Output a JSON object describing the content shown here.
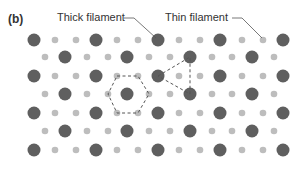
{
  "figure": {
    "panel_label": "(b)",
    "labels": {
      "thick": "Thick filament",
      "thin": "Thin filament"
    },
    "colors": {
      "thick_filament": "#5f5f5f",
      "thin_filament": "#bdbdbd",
      "dashed_line": "#555555",
      "leader_line": "#555555",
      "text": "#333333"
    },
    "lattice": {
      "row_y": [
        40,
        57,
        76,
        94,
        113,
        131,
        150
      ],
      "row_type_A_big_x": [
        34,
        96,
        158,
        220,
        283
      ],
      "row_type_A_small_x": [
        55,
        76,
        117,
        138,
        179,
        200,
        242,
        263
      ],
      "row_type_B_big_x": [
        65,
        127,
        190,
        252
      ],
      "row_type_B_small_x": [
        45,
        87,
        108,
        149,
        170,
        212,
        232,
        274
      ],
      "row_types": [
        "A",
        "B",
        "A",
        "B",
        "A",
        "B",
        "A"
      ],
      "big_radius": 6.5,
      "small_radius": 3.3
    },
    "hexagon": {
      "center": [
        127,
        94
      ],
      "vertices": [
        [
          117,
          76
        ],
        [
          138,
          76
        ],
        [
          149,
          94
        ],
        [
          138,
          113
        ],
        [
          117,
          113
        ],
        [
          108,
          94
        ]
      ]
    },
    "triangle": {
      "vertices": [
        [
          158,
          76
        ],
        [
          190,
          57
        ],
        [
          190,
          94
        ]
      ]
    },
    "leaders": {
      "thick": {
        "start": [
          124,
          18
        ],
        "bend": [
          134,
          18
        ],
        "end": [
          156,
          38
        ]
      },
      "thin": {
        "start": [
          232,
          18
        ],
        "bend": [
          242,
          18
        ],
        "end": [
          262,
          38
        ]
      }
    }
  }
}
